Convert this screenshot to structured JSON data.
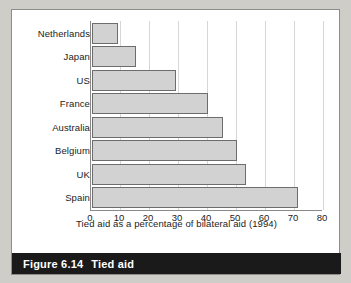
{
  "figure": {
    "caption_number": "Figure 6.14",
    "caption_title": "Tied aid"
  },
  "chart_data": {
    "type": "bar",
    "orientation": "horizontal",
    "title": "",
    "xlabel": "Tied aid as a percentage of bilateral aid (1994)",
    "ylabel": "",
    "categories": [
      "Netherlands",
      "Japan",
      "US",
      "France",
      "Australia",
      "Belgium",
      "UK",
      "Spain"
    ],
    "values": [
      9,
      15,
      29,
      40,
      45,
      50,
      53,
      71
    ],
    "xlim": [
      0,
      80
    ],
    "xticks": [
      0,
      10,
      20,
      30,
      40,
      50,
      60,
      70,
      80
    ],
    "xtick_labels": [
      "0",
      "10",
      "20",
      "30",
      "40",
      "50",
      "60",
      "70",
      "80"
    ],
    "grid": true,
    "grid_axis": "x",
    "legend": false,
    "bar_fill": "#d2d2d2",
    "bar_border": "#6d6d6d"
  },
  "colors": {
    "page_background": "#cfcdc8",
    "figure_background": "#ffffff",
    "caption_background": "#1a1a1a",
    "caption_text": "#ffffff",
    "axis": "#8a8a8a",
    "gridline": "#d6d6d6",
    "text": "#1c1c1c"
  }
}
